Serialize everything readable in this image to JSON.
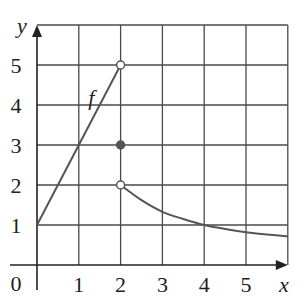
{
  "chart_data": {
    "type": "line",
    "title": "",
    "xlabel": "x",
    "ylabel": "y",
    "xlim": [
      0,
      6
    ],
    "ylim": [
      0,
      6
    ],
    "grid": true,
    "x_ticks": [
      "0",
      "1",
      "2",
      "3",
      "4",
      "5"
    ],
    "y_ticks": [
      "1",
      "2",
      "3",
      "4",
      "5"
    ],
    "origin_label": "0",
    "function_label": "f",
    "series": [
      {
        "name": "f (x < 2, linear)",
        "x": [
          0,
          2
        ],
        "y": [
          1,
          5
        ]
      },
      {
        "name": "f (x > 2, decreasing)",
        "x": [
          2,
          2.5,
          3,
          3.5,
          4,
          4.5,
          5,
          5.5,
          6
        ],
        "y": [
          2,
          1.62,
          1.33,
          1.15,
          1.0,
          0.9,
          0.82,
          0.76,
          0.72
        ]
      }
    ],
    "points": [
      {
        "x": 2,
        "y": 5,
        "style": "open"
      },
      {
        "x": 2,
        "y": 3,
        "style": "filled"
      },
      {
        "x": 2,
        "y": 2,
        "style": "open"
      }
    ],
    "annotations": [
      {
        "text": "f",
        "x": 1.3,
        "y": 4.2
      }
    ]
  },
  "geometry": {
    "x0_px": 37,
    "x_unit_px": 41.8,
    "y0_px": 265,
    "y_unit_px": 40
  },
  "colors": {
    "grid": "#4a4a4a",
    "axis": "#222222",
    "curve": "#555555",
    "filled_point": "#555555",
    "background": "#ffffff"
  }
}
